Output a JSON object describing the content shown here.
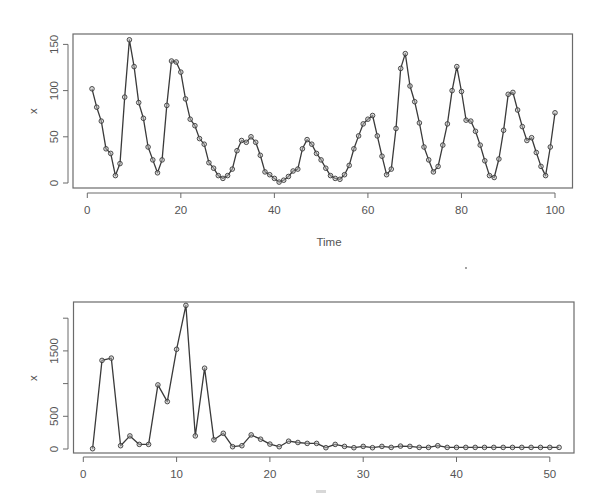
{
  "chart_data": [
    {
      "type": "line",
      "title": "",
      "xlabel": "Time",
      "ylabel": "x",
      "xlim": [
        -3,
        103
      ],
      "ylim": [
        -5,
        160
      ],
      "xticks": [
        0,
        20,
        40,
        60,
        80,
        100
      ],
      "xtick_labels": [
        "0",
        "20",
        "40",
        "60",
        "80",
        "100"
      ],
      "yticks": [
        0,
        50,
        100,
        150
      ],
      "ytick_labels": [
        "0",
        "50",
        "100",
        "150"
      ],
      "grid": false,
      "markers": "open-circle",
      "series": [
        {
          "name": "x",
          "x": [
            1,
            2,
            3,
            4,
            5,
            6,
            7,
            8,
            9,
            10,
            11,
            12,
            13,
            14,
            15,
            16,
            17,
            18,
            19,
            20,
            21,
            22,
            23,
            24,
            25,
            26,
            27,
            28,
            29,
            30,
            31,
            32,
            33,
            34,
            35,
            36,
            37,
            38,
            39,
            40,
            41,
            42,
            43,
            44,
            45,
            46,
            47,
            48,
            49,
            50,
            51,
            52,
            53,
            54,
            55,
            56,
            57,
            58,
            59,
            60,
            61,
            62,
            63,
            64,
            65,
            66,
            67,
            68,
            69,
            70,
            71,
            72,
            73,
            74,
            75,
            76,
            77,
            78,
            79,
            80,
            81,
            82,
            83,
            84,
            85,
            86,
            87,
            88,
            89,
            90,
            91,
            92,
            93,
            94,
            95,
            96,
            97,
            98,
            99,
            100
          ],
          "values": [
            102,
            82,
            67,
            37,
            32,
            8,
            21,
            93,
            155,
            126,
            87,
            70,
            39,
            25,
            11,
            25,
            84,
            132,
            131,
            120,
            91,
            69,
            62,
            48,
            42,
            22,
            16,
            8,
            5,
            8,
            15,
            35,
            46,
            44,
            50,
            44,
            30,
            12,
            9,
            5,
            1,
            3,
            7,
            13,
            15,
            37,
            47,
            42,
            32,
            25,
            16,
            8,
            5,
            4,
            9,
            19,
            37,
            51,
            64,
            69,
            73,
            51,
            29,
            9,
            15,
            59,
            124,
            140,
            105,
            88,
            65,
            39,
            25,
            12,
            18,
            41,
            64,
            100,
            126,
            99,
            68,
            67,
            56,
            41,
            24,
            8,
            6,
            26,
            57,
            96,
            98,
            79,
            61,
            46,
            49,
            33,
            18,
            8,
            39,
            76
          ]
        }
      ]
    },
    {
      "type": "line",
      "title": "",
      "xlabel": "",
      "ylabel": "x",
      "xlim": [
        -1,
        53
      ],
      "ylim": [
        -50,
        2300
      ],
      "xticks": [
        0,
        10,
        20,
        30,
        40,
        50
      ],
      "xtick_labels": [
        "0",
        "10",
        "20",
        "30",
        "40",
        "50"
      ],
      "yticks": [
        0,
        500,
        1000,
        1500,
        2000
      ],
      "ytick_labels": [
        "0",
        "500",
        "",
        "1500",
        ""
      ],
      "grid": false,
      "markers": "open-circle",
      "series": [
        {
          "name": "x",
          "x": [
            1,
            2,
            3,
            4,
            5,
            6,
            7,
            8,
            9,
            10,
            11,
            12,
            13,
            14,
            15,
            16,
            17,
            18,
            19,
            20,
            21,
            22,
            23,
            24,
            25,
            26,
            27,
            28,
            29,
            30,
            31,
            32,
            33,
            34,
            35,
            36,
            37,
            38,
            39,
            40,
            41,
            42,
            43,
            44,
            45,
            46,
            47,
            48,
            49,
            50,
            51
          ],
          "values": [
            5,
            1355,
            1390,
            50,
            200,
            70,
            70,
            980,
            725,
            1525,
            2195,
            200,
            1235,
            140,
            240,
            35,
            50,
            215,
            150,
            75,
            35,
            120,
            100,
            85,
            85,
            20,
            70,
            40,
            20,
            40,
            20,
            40,
            25,
            45,
            40,
            25,
            25,
            50,
            25,
            25,
            25,
            25,
            25,
            25,
            25,
            25,
            25,
            25,
            25,
            25,
            25
          ]
        }
      ]
    }
  ],
  "top_chart": {
    "xlabel": "Time",
    "ylabel": "x",
    "xtick_labels": [
      "0",
      "20",
      "40",
      "60",
      "80",
      "100"
    ],
    "ytick_labels": [
      "0",
      "50",
      "100",
      "150"
    ]
  },
  "bottom_chart": {
    "ylabel": "x",
    "xtick_labels": [
      "0",
      "10",
      "20",
      "30",
      "40",
      "50"
    ],
    "ytick_labels": [
      "0",
      "500",
      "1500"
    ]
  }
}
